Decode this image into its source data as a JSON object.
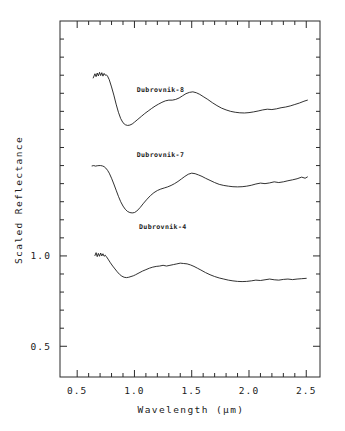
{
  "chart_data": {
    "type": "line",
    "title": "",
    "xlabel": "Wavelength  (μm)",
    "ylabel": "Scaled Reflectance",
    "xlim": [
      0.35,
      2.62
    ],
    "ylim": [
      0.33,
      2.3
    ],
    "grid": false,
    "legend_position": "inline-annotations",
    "xticks_major": [
      0.5,
      1.0,
      1.5,
      2.0,
      2.5
    ],
    "xtick_labels": [
      "0.5",
      "1.0",
      "1.5",
      "2.0",
      "2.5"
    ],
    "xticks_minor": [
      0.6,
      0.7,
      0.8,
      0.9,
      1.1,
      1.2,
      1.3,
      1.4,
      1.6,
      1.7,
      1.8,
      1.9,
      2.1,
      2.2,
      2.3,
      2.4
    ],
    "yticks_major": [
      0.5,
      1.0
    ],
    "ytick_labels": [
      "0.5",
      "1.0"
    ],
    "yticks_minor": [
      0.6,
      0.7,
      0.8,
      0.9,
      1.1,
      1.2,
      1.3,
      1.4,
      1.5,
      1.6,
      1.7,
      1.8,
      1.9,
      2.0,
      2.1,
      2.2
    ],
    "line_color": "#1b1b1b",
    "frame_color": "#2b2b2b",
    "series": [
      {
        "name": "Dubrovnik-8",
        "label": "Dubrovnik-8",
        "label_x": 1.02,
        "label_y": 1.905,
        "x": [
          0.64,
          0.655,
          0.665,
          0.675,
          0.685,
          0.695,
          0.705,
          0.715,
          0.725,
          0.735,
          0.745,
          0.755,
          0.765,
          0.78,
          0.8,
          0.82,
          0.84,
          0.86,
          0.88,
          0.9,
          0.92,
          0.94,
          0.96,
          0.98,
          1.0,
          1.03,
          1.06,
          1.09,
          1.12,
          1.15,
          1.18,
          1.21,
          1.24,
          1.27,
          1.3,
          1.33,
          1.36,
          1.39,
          1.42,
          1.45,
          1.48,
          1.51,
          1.54,
          1.57,
          1.6,
          1.64,
          1.68,
          1.72,
          1.76,
          1.8,
          1.84,
          1.88,
          1.92,
          1.96,
          2.0,
          2.04,
          2.08,
          2.12,
          2.16,
          2.2,
          2.24,
          2.28,
          2.32,
          2.36,
          2.4,
          2.44,
          2.48,
          2.51
        ],
        "y": [
          1.985,
          2.008,
          1.992,
          2.012,
          1.996,
          2.016,
          1.998,
          2.014,
          1.995,
          2.01,
          2.0,
          2.002,
          1.995,
          1.975,
          1.935,
          1.89,
          1.84,
          1.795,
          1.76,
          1.737,
          1.726,
          1.722,
          1.724,
          1.73,
          1.74,
          1.756,
          1.772,
          1.788,
          1.802,
          1.816,
          1.829,
          1.84,
          1.85,
          1.858,
          1.862,
          1.862,
          1.866,
          1.874,
          1.886,
          1.898,
          1.905,
          1.908,
          1.903,
          1.894,
          1.882,
          1.866,
          1.848,
          1.832,
          1.818,
          1.808,
          1.8,
          1.795,
          1.792,
          1.791,
          1.793,
          1.797,
          1.802,
          1.808,
          1.812,
          1.81,
          1.814,
          1.82,
          1.824,
          1.83,
          1.838,
          1.846,
          1.856,
          1.862
        ]
      },
      {
        "name": "Dubrovnik-7",
        "label": "Dubrovnik-7",
        "label_x": 1.02,
        "label_y": 1.545,
        "x": [
          0.63,
          0.645,
          0.66,
          0.675,
          0.69,
          0.705,
          0.72,
          0.735,
          0.75,
          0.765,
          0.78,
          0.8,
          0.82,
          0.84,
          0.86,
          0.88,
          0.9,
          0.92,
          0.94,
          0.96,
          0.98,
          1.0,
          1.02,
          1.05,
          1.08,
          1.11,
          1.14,
          1.17,
          1.2,
          1.23,
          1.26,
          1.29,
          1.32,
          1.35,
          1.38,
          1.41,
          1.44,
          1.47,
          1.5,
          1.53,
          1.56,
          1.59,
          1.62,
          1.66,
          1.7,
          1.74,
          1.78,
          1.82,
          1.86,
          1.9,
          1.94,
          1.98,
          2.02,
          2.06,
          2.1,
          2.14,
          2.18,
          2.22,
          2.26,
          2.3,
          2.34,
          2.38,
          2.42,
          2.46,
          2.49,
          2.51
        ],
        "y": [
          1.498,
          1.5,
          1.497,
          1.499,
          1.5,
          1.5,
          1.498,
          1.494,
          1.486,
          1.474,
          1.458,
          1.43,
          1.398,
          1.364,
          1.33,
          1.3,
          1.276,
          1.258,
          1.246,
          1.24,
          1.238,
          1.24,
          1.248,
          1.268,
          1.292,
          1.314,
          1.334,
          1.35,
          1.362,
          1.37,
          1.376,
          1.382,
          1.39,
          1.4,
          1.412,
          1.426,
          1.44,
          1.452,
          1.458,
          1.455,
          1.448,
          1.44,
          1.43,
          1.418,
          1.406,
          1.396,
          1.39,
          1.386,
          1.383,
          1.382,
          1.383,
          1.386,
          1.391,
          1.398,
          1.403,
          1.4,
          1.404,
          1.41,
          1.406,
          1.41,
          1.416,
          1.421,
          1.427,
          1.436,
          1.43,
          1.437
        ]
      },
      {
        "name": "Dubrovnik-4",
        "label": "Dubrovnik-4",
        "label_x": 1.04,
        "label_y": 1.15,
        "x": [
          0.655,
          0.665,
          0.675,
          0.685,
          0.695,
          0.705,
          0.715,
          0.725,
          0.735,
          0.745,
          0.755,
          0.77,
          0.79,
          0.81,
          0.83,
          0.85,
          0.87,
          0.89,
          0.91,
          0.93,
          0.95,
          0.97,
          0.99,
          1.01,
          1.04,
          1.07,
          1.1,
          1.13,
          1.16,
          1.19,
          1.22,
          1.25,
          1.28,
          1.31,
          1.34,
          1.37,
          1.4,
          1.43,
          1.46,
          1.49,
          1.52,
          1.55,
          1.58,
          1.62,
          1.66,
          1.7,
          1.74,
          1.78,
          1.82,
          1.86,
          1.9,
          1.94,
          1.98,
          2.02,
          2.06,
          2.1,
          2.14,
          2.18,
          2.22,
          2.26,
          2.3,
          2.34,
          2.38,
          2.42,
          2.46,
          2.5
        ],
        "y": [
          1.002,
          1.018,
          0.996,
          1.014,
          0.998,
          1.016,
          1.0,
          1.012,
          0.998,
          1.004,
          0.996,
          0.982,
          0.962,
          0.944,
          0.928,
          0.912,
          0.898,
          0.888,
          0.882,
          0.88,
          0.882,
          0.886,
          0.89,
          0.896,
          0.906,
          0.916,
          0.924,
          0.932,
          0.938,
          0.942,
          0.944,
          0.948,
          0.944,
          0.948,
          0.952,
          0.956,
          0.96,
          0.958,
          0.956,
          0.95,
          0.942,
          0.932,
          0.922,
          0.908,
          0.896,
          0.886,
          0.878,
          0.872,
          0.866,
          0.862,
          0.859,
          0.858,
          0.859,
          0.862,
          0.866,
          0.864,
          0.868,
          0.872,
          0.868,
          0.866,
          0.87,
          0.872,
          0.869,
          0.872,
          0.874,
          0.876
        ]
      }
    ]
  },
  "axes": {
    "x_title": "Wavelength  (μm)",
    "y_title": "Scaled Reflectance"
  }
}
